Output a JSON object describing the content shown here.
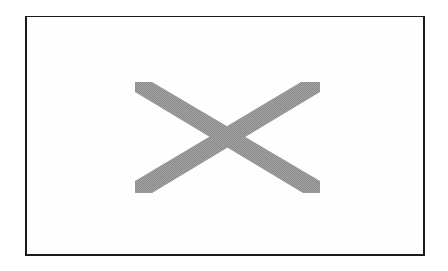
{
  "placeholder": {
    "label": "Image placeholder",
    "icon": "cross-icon",
    "border_color": "#1a1a1a",
    "cross_color": "#999999",
    "background": "#ffffff"
  }
}
